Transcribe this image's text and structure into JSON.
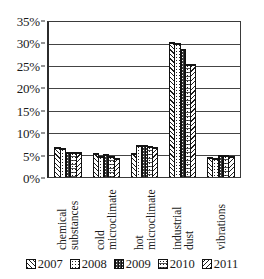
{
  "chart_data": {
    "type": "bar",
    "title": "",
    "subtitle": "",
    "xlabel": "",
    "ylabel": "",
    "ylim": [
      0,
      35
    ],
    "ytick_labels": [
      "0%",
      "5%",
      "10%",
      "15%",
      "20%",
      "25%",
      "30%",
      "35%"
    ],
    "ytick_values": [
      0,
      5,
      10,
      15,
      20,
      25,
      30,
      35
    ],
    "grid": true,
    "legend_position": "bottom",
    "value_unit": "%",
    "categories": [
      "chemical substances",
      "cold microclimate",
      "hot microclimate",
      "industrial dust",
      "vibrations"
    ],
    "category_lines": [
      [
        "chemical",
        "substances"
      ],
      [
        "cold",
        "microclimate"
      ],
      [
        "hot",
        "microclimate"
      ],
      [
        "industrial",
        "dust"
      ],
      [
        "vibrations"
      ]
    ],
    "series": [
      {
        "name": "2007",
        "pattern": "diagonal-hatch-right",
        "values": [
          6.8,
          5.3,
          5.3,
          30.3,
          4.6
        ]
      },
      {
        "name": "2008",
        "pattern": "dotted",
        "values": [
          6.5,
          4.8,
          7.2,
          30.1,
          4.2
        ]
      },
      {
        "name": "2009",
        "pattern": "dark-solid",
        "values": [
          5.6,
          5.1,
          7.1,
          28.8,
          4.9
        ]
      },
      {
        "name": "2010",
        "pattern": "dotted-dark",
        "values": [
          5.6,
          4.8,
          6.9,
          25.3,
          4.9
        ]
      },
      {
        "name": "2011",
        "pattern": "diagonal-hatch-left",
        "values": [
          5.6,
          4.2,
          6.7,
          25.4,
          4.8
        ]
      }
    ]
  },
  "legend": {
    "items": [
      {
        "label": "2007"
      },
      {
        "label": "2008"
      },
      {
        "label": "2009"
      },
      {
        "label": "2010"
      },
      {
        "label": "2011"
      }
    ]
  }
}
